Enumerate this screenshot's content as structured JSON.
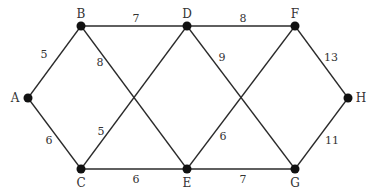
{
  "diagram": {
    "type": "weighted-graph",
    "nodes": [
      {
        "id": "A",
        "label": "A",
        "x": 28,
        "y": 98
      },
      {
        "id": "B",
        "label": "B",
        "x": 81,
        "y": 26
      },
      {
        "id": "C",
        "label": "C",
        "x": 81,
        "y": 169
      },
      {
        "id": "D",
        "label": "D",
        "x": 187,
        "y": 26
      },
      {
        "id": "E",
        "label": "E",
        "x": 187,
        "y": 169
      },
      {
        "id": "F",
        "label": "F",
        "x": 295,
        "y": 26
      },
      {
        "id": "G",
        "label": "G",
        "x": 295,
        "y": 169
      },
      {
        "id": "H",
        "label": "H",
        "x": 348,
        "y": 98
      }
    ],
    "edges": [
      {
        "from": "A",
        "to": "B",
        "weight": "5"
      },
      {
        "from": "A",
        "to": "C",
        "weight": "6"
      },
      {
        "from": "B",
        "to": "D",
        "weight": "7"
      },
      {
        "from": "B",
        "to": "E",
        "weight": "8"
      },
      {
        "from": "C",
        "to": "D",
        "weight": "5"
      },
      {
        "from": "C",
        "to": "E",
        "weight": "6"
      },
      {
        "from": "D",
        "to": "F",
        "weight": "8"
      },
      {
        "from": "D",
        "to": "G",
        "weight": "9"
      },
      {
        "from": "E",
        "to": "F",
        "weight": "6"
      },
      {
        "from": "E",
        "to": "G",
        "weight": "7"
      },
      {
        "from": "F",
        "to": "H",
        "weight": "13"
      },
      {
        "from": "G",
        "to": "H",
        "weight": "11"
      }
    ]
  }
}
